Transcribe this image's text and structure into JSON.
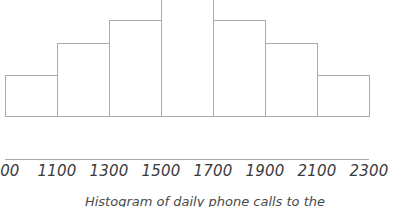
{
  "caption": "Histogram of daily phone calls to the",
  "colors": {
    "bar_outline": "#aaaaaa",
    "axis": "#aaaaaa",
    "text": "#3a3a3a",
    "background": "#ffffff"
  },
  "chart_data": {
    "type": "bar",
    "title": "Histogram of daily phone calls to the",
    "xlabel": "",
    "ylabel": "",
    "grid": false,
    "legend": null,
    "bin_width": 200,
    "bin_edges": [
      900,
      1100,
      1300,
      1500,
      1700,
      1900,
      2100,
      2300
    ],
    "tick_labels": [
      "900",
      "1100",
      "1300",
      "1500",
      "1700",
      "1900",
      "2100",
      "2300"
    ],
    "categories": [
      "900-1100",
      "1100-1300",
      "1300-1500",
      "1500-1700",
      "1700-1900",
      "1900-2100",
      "2100-2300"
    ],
    "values": [
      42,
      74,
      97,
      151,
      97,
      74,
      42
    ],
    "ylim": [
      0,
      160
    ],
    "xlim": [
      900,
      2300
    ]
  }
}
